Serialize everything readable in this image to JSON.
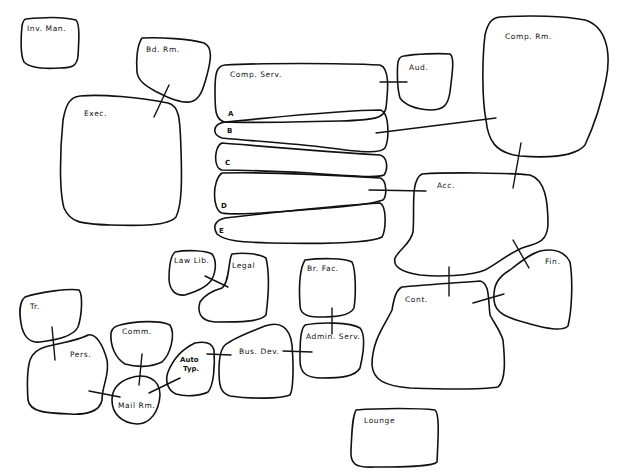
{
  "diagram": {
    "type": "bubble-adjacency-diagram",
    "rooms": [
      {
        "id": "inv-man",
        "label": "Inv. Man."
      },
      {
        "id": "bd-rm",
        "label": "Bd. Rm."
      },
      {
        "id": "exec",
        "label": "Exec."
      },
      {
        "id": "comp-serv",
        "label": "Comp. Serv."
      },
      {
        "id": "comp-serv-a",
        "label": "A"
      },
      {
        "id": "comp-serv-b",
        "label": "B"
      },
      {
        "id": "comp-serv-c",
        "label": "C"
      },
      {
        "id": "comp-serv-d",
        "label": "D"
      },
      {
        "id": "comp-serv-e",
        "label": "E"
      },
      {
        "id": "aud",
        "label": "Aud."
      },
      {
        "id": "comp-rm",
        "label": "Comp. Rm."
      },
      {
        "id": "acc",
        "label": "Acc."
      },
      {
        "id": "fin",
        "label": "Fin."
      },
      {
        "id": "cont",
        "label": "Cont."
      },
      {
        "id": "law-lib",
        "label": "Law Lib."
      },
      {
        "id": "legal",
        "label": "Legal"
      },
      {
        "id": "br-fac",
        "label": "Br. Fac."
      },
      {
        "id": "admin-serv",
        "label": "Admin. Serv."
      },
      {
        "id": "bus-dev",
        "label": "Bus. Dev."
      },
      {
        "id": "auto-typ",
        "label": "Auto Typ."
      },
      {
        "id": "auto-typ-line1",
        "label": "Auto"
      },
      {
        "id": "auto-typ-line2",
        "label": "Typ."
      },
      {
        "id": "tr",
        "label": "Tr."
      },
      {
        "id": "pers",
        "label": "Pers."
      },
      {
        "id": "comm",
        "label": "Comm."
      },
      {
        "id": "mail-rm",
        "label": "Mail Rm."
      },
      {
        "id": "lounge",
        "label": "Lounge"
      }
    ],
    "connections": [
      [
        "Bd. Rm.",
        "Exec."
      ],
      [
        "Comp. Serv.",
        "Aud."
      ],
      [
        "Comp. Serv. B",
        "Comp. Rm."
      ],
      [
        "Comp. Rm.",
        "Acc."
      ],
      [
        "Comp. Serv. D",
        "Acc."
      ],
      [
        "Acc.",
        "Fin."
      ],
      [
        "Acc.",
        "Cont."
      ],
      [
        "Cont.",
        "Fin."
      ],
      [
        "Law Lib.",
        "Legal"
      ],
      [
        "Br. Fac.",
        "Admin. Serv."
      ],
      [
        "Bus. Dev.",
        "Admin. Serv."
      ],
      [
        "Auto Typ.",
        "Bus. Dev."
      ],
      [
        "Tr.",
        "Pers."
      ],
      [
        "Pers.",
        "Mail Rm."
      ],
      [
        "Comm.",
        "Mail Rm."
      ],
      [
        "Auto Typ.",
        "Mail Rm."
      ]
    ]
  }
}
